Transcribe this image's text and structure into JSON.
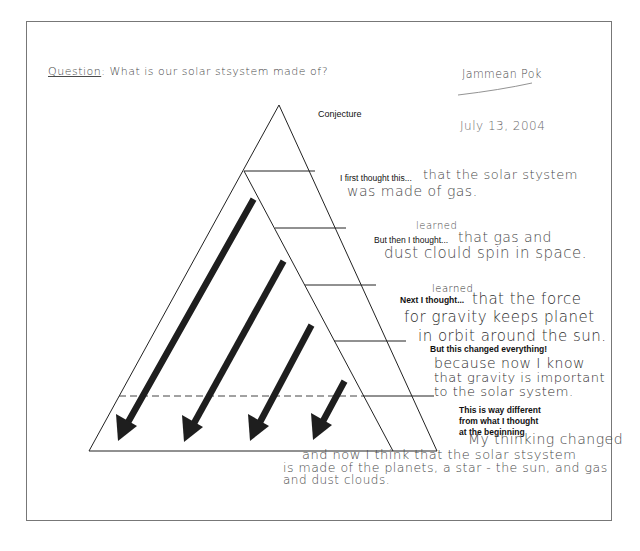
{
  "header": {
    "question_label": "Question",
    "question_text": ": What is our solar stsystem made of?",
    "student_name": "Jammean Pok",
    "date": "July 13, 2004"
  },
  "diagram": {
    "title": "Conjecture",
    "line_color": "#222222",
    "arrow_color": "#1e1e1e",
    "arrow_count": 4
  },
  "sections": [
    {
      "prompt": "I first thought this...",
      "response_line1": "that the solar stystem",
      "response_line2": "was made of gas."
    },
    {
      "prompt": "But then I thought...",
      "insert": "learned",
      "response_line1": "that gas and",
      "response_line2": "dust clould spin in space."
    },
    {
      "prompt": "Next I thought...",
      "insert": "learned",
      "response_line1": "that the force",
      "response_line2": "for gravity keeps planet",
      "response_line3": "in orbit around the sun."
    },
    {
      "prompt": "But this changed everything!",
      "response_line1": "because now I know",
      "response_line2": "that gravity is important",
      "response_line3": "to the solar system."
    },
    {
      "prompt_line1": "This is way different",
      "prompt_line2": "from what I thought",
      "prompt_line3": "at the beginning",
      "response_line1": "My thinking changed",
      "response_line2": "and now I think that the solar stsystem",
      "response_line3": "is made of the planets, a star - the sun, and gas",
      "response_line4": "and dust clouds."
    }
  ]
}
